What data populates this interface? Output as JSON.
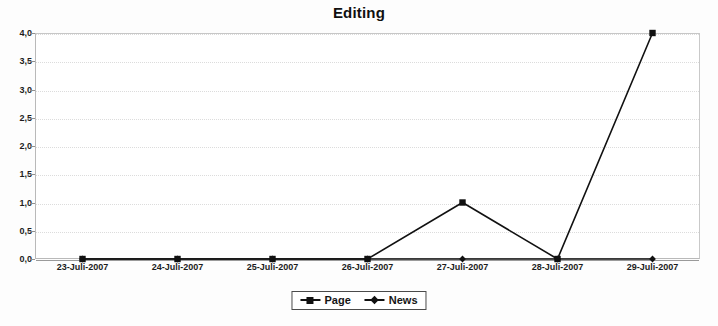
{
  "chart_data": {
    "type": "line",
    "title": "Editing",
    "xlabel": "",
    "ylabel": "",
    "categories": [
      "23-Juli-2007",
      "24-Juli-2007",
      "25-Juli-2007",
      "26-Juli-2007",
      "27-Juli-2007",
      "28-Juli-2007",
      "29-Juli-2007"
    ],
    "series": [
      {
        "name": "Page",
        "marker": "square",
        "color": "#111111",
        "values": [
          0,
          0,
          0,
          0,
          1,
          0,
          4
        ]
      },
      {
        "name": "News",
        "marker": "diamond",
        "color": "#111111",
        "values": [
          0,
          0,
          0,
          0,
          0,
          0,
          0
        ]
      }
    ],
    "ylim": [
      0,
      4
    ],
    "yticks": [
      0.0,
      0.5,
      1.0,
      1.5,
      2.0,
      2.5,
      3.0,
      3.5,
      4.0
    ],
    "ytick_labels": [
      "0,0",
      "0,5",
      "1,0",
      "1,5",
      "2,0",
      "2,5",
      "3,0",
      "3,5",
      "4,0"
    ],
    "grid": true,
    "legend_position": "bottom-center"
  },
  "legend": {
    "entries": [
      {
        "label": "Page",
        "marker": "square"
      },
      {
        "label": "News",
        "marker": "diamond"
      }
    ]
  }
}
